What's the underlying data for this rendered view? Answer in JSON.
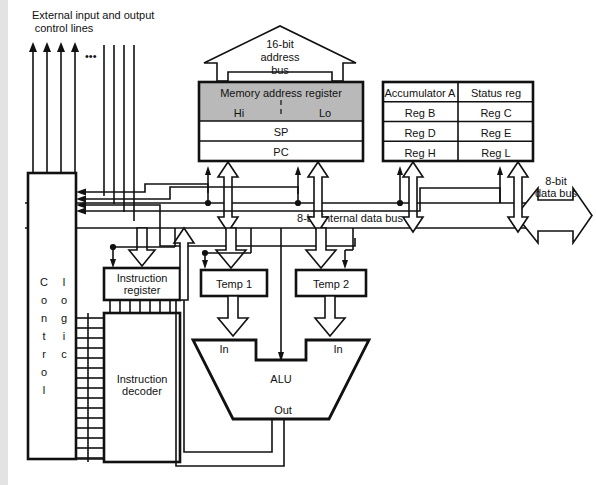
{
  "diagram": {
    "background_color": "#ffffff",
    "line_color": "#111111",
    "register_fill_color": "#b9b9b9",
    "box_fill_color": "#ffffff"
  },
  "labels": {
    "external_lines_line1": "External input and output",
    "external_lines_line2": "control lines",
    "ellipsis": "•••",
    "address_bus_line1": "16-bit",
    "address_bus_line2": "address",
    "address_bus_line3": "bus",
    "data_bus_line1": "8-bit",
    "data_bus_line2": "data bus",
    "internal_data_bus": "8-bit internal data bus"
  },
  "memory_address_register": {
    "title": "Memory address register",
    "hi": "Hi",
    "lo": "Lo",
    "rows": [
      "SP",
      "PC"
    ]
  },
  "register_file": {
    "rows": [
      [
        "Accumulator A",
        "Status reg"
      ],
      [
        "Reg B",
        "Reg C"
      ],
      [
        "Reg D",
        "Reg E"
      ],
      [
        "Reg H",
        "Reg L"
      ]
    ]
  },
  "control_logic": {
    "word1_letters": [
      "C",
      "o",
      "n",
      "t",
      "r",
      "o",
      "l"
    ],
    "word2_letters": [
      "l",
      "o",
      "g",
      "i",
      "c"
    ],
    "full_label": "Control logic"
  },
  "instruction_register": {
    "line1": "Instruction",
    "line2": "register"
  },
  "instruction_decoder": {
    "line1": "Instruction",
    "line2": "decoder"
  },
  "temp_registers": [
    {
      "label": "Temp 1"
    },
    {
      "label": "Temp 2"
    }
  ],
  "alu": {
    "label": "ALU",
    "input_left": "In",
    "input_right": "In",
    "output": "Out"
  }
}
